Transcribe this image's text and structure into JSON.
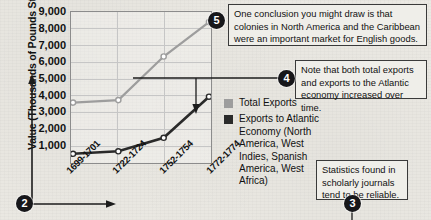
{
  "chart_data": {
    "type": "line",
    "title": "",
    "xlabel": "",
    "ylabel": "Value (Thousands of Pounds Sterling)",
    "categories": [
      "1699-1701",
      "1722-1724",
      "1752-1754",
      "1772-1774"
    ],
    "yticks": [
      "1,000",
      "2,000",
      "3,000",
      "4,000",
      "5,000",
      "6,000",
      "7,000",
      "8,000",
      "9,000"
    ],
    "ylim": [
      0,
      9000
    ],
    "grid": true,
    "legend_position": "right",
    "series": [
      {
        "name": "Total Exports",
        "color": "#9d9d9d",
        "values": [
          3600,
          3750,
          6350,
          8400
        ]
      },
      {
        "name": "Exports to Atlantic Economy (North America, West Indies, Spanish America, West Africa)",
        "color": "#2a2a2a",
        "values": [
          550,
          700,
          1500,
          3950
        ]
      }
    ]
  },
  "legend": {
    "items": [
      {
        "label": "Total Exports",
        "swatch": "total"
      },
      {
        "label": "Exports to Atlantic Economy (North America, West Indies, Spanish America, West Africa)",
        "swatch": "atl"
      }
    ]
  },
  "callouts": [
    {
      "number": "5",
      "text": "One conclusion you might draw is that colonies in North America and the Caribbean were an important market for English goods."
    },
    {
      "number": "4",
      "text": "Note that both total exports and exports to the Atlantic economy increased over time."
    },
    {
      "number": "3",
      "text": "Statistics found in scholarly journals tend to be reliable."
    },
    {
      "number": "2",
      "text": ""
    }
  ],
  "colors": {
    "total_exports": "#9d9d9d",
    "atlantic_exports": "#2a2a2a",
    "badge": "#17171a",
    "background": "#eceae4"
  }
}
